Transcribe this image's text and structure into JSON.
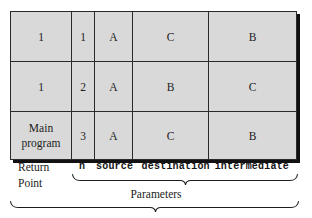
{
  "figure": {
    "type": "stack-frame-table",
    "caption_labels": {
      "return_point": [
        "Return",
        "Point"
      ],
      "parameters": "Parameters"
    }
  },
  "table": {
    "columns": [
      {
        "key": "return_point",
        "header": "Return Point",
        "footer_label": ""
      },
      {
        "key": "n",
        "header": "n",
        "footer_label": "n"
      },
      {
        "key": "source",
        "header": "source",
        "footer_label": "source"
      },
      {
        "key": "destination",
        "header": "destination",
        "footer_label": "destination"
      },
      {
        "key": "intermediate",
        "header": "intermediate",
        "footer_label": "intermediate"
      }
    ],
    "rows": [
      {
        "return_point_line1": "1",
        "return_point_line2": "",
        "n": "1",
        "source": "A",
        "destination": "C",
        "intermediate": "B"
      },
      {
        "return_point_line1": "1",
        "return_point_line2": "",
        "n": "2",
        "source": "A",
        "destination": "B",
        "intermediate": "C"
      },
      {
        "return_point_line1": "Main",
        "return_point_line2": "program",
        "n": "3",
        "source": "A",
        "destination": "C",
        "intermediate": "B"
      }
    ]
  },
  "annotations": {
    "return_point_line1": "Return",
    "return_point_line2": "Point",
    "param_n": "n",
    "param_source": "source",
    "param_destination": "destination",
    "param_intermediate": "intermediate",
    "parameters_brace_label": "Parameters"
  },
  "colors": {
    "cell_fill": "#d9d9d9",
    "border": "#2a2a2a",
    "outer_border": "#1c1c1c",
    "shadow": "#111111",
    "text": "#1c1c1c",
    "page_background": "#ffffff"
  }
}
